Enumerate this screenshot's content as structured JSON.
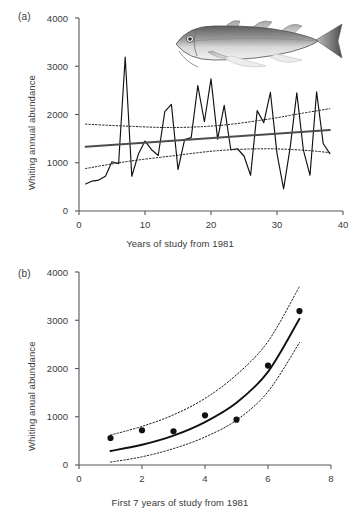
{
  "figure": {
    "panel_a_label": "(a)",
    "panel_b_label": "(b)",
    "fish_icon": "whiting-fish-illustration"
  },
  "chart_data": [
    {
      "id": "panel-a",
      "type": "line",
      "title": "",
      "panel": "(a)",
      "xlabel": "Years of study from 1981",
      "ylabel": "Whiting annual abundance",
      "xlim": [
        0,
        40
      ],
      "ylim": [
        0,
        4000
      ],
      "xticks": [
        0,
        10,
        20,
        30,
        40
      ],
      "yticks": [
        0,
        1000,
        2000,
        3000,
        4000
      ],
      "xtick_labels": [
        "0",
        "10",
        "20",
        "30",
        "40"
      ],
      "ytick_labels": [
        "0",
        "1000",
        "2000",
        "3000",
        "4000"
      ],
      "grid": false,
      "legend": "none",
      "annotation": "whiting fish illustration, top right",
      "series": [
        {
          "name": "Whiting annual abundance",
          "style": "solid-thin-black",
          "x": [
            1,
            2,
            3,
            4,
            5,
            6,
            7,
            8,
            9,
            10,
            11,
            12,
            13,
            14,
            15,
            16,
            17,
            18,
            19,
            20,
            21,
            22,
            23,
            24,
            25,
            26,
            27,
            28,
            29,
            30,
            31,
            32,
            33,
            34,
            35,
            36,
            37,
            38
          ],
          "values": [
            560,
            620,
            640,
            720,
            1020,
            980,
            3190,
            720,
            1180,
            1450,
            1270,
            1150,
            2060,
            2210,
            860,
            1480,
            1520,
            2600,
            1850,
            2740,
            1490,
            2190,
            1270,
            1290,
            1140,
            740,
            2080,
            1830,
            2460,
            1190,
            460,
            1320,
            2450,
            1260,
            740,
            2470,
            1400,
            1190
          ]
        },
        {
          "name": "Linear trend",
          "style": "solid-thick-gray",
          "x": [
            1,
            38
          ],
          "values": [
            1330,
            1680
          ]
        },
        {
          "name": "Upper confidence band",
          "style": "dotted-black",
          "x": [
            1,
            7,
            14,
            21,
            28,
            34,
            38
          ],
          "values": [
            1800,
            1760,
            1730,
            1770,
            1890,
            2030,
            2120
          ]
        },
        {
          "name": "Lower confidence band",
          "style": "dotted-black",
          "x": [
            1,
            7,
            14,
            21,
            28,
            34,
            38
          ],
          "values": [
            880,
            1020,
            1140,
            1250,
            1290,
            1260,
            1210
          ]
        }
      ]
    },
    {
      "id": "panel-b",
      "type": "scatter",
      "title": "",
      "panel": "(b)",
      "xlabel": "First 7 years of study from 1981",
      "ylabel": "Whiting anual abundance",
      "xlim": [
        0,
        8
      ],
      "ylim": [
        0,
        4000
      ],
      "xticks": [
        0,
        2,
        4,
        6,
        8
      ],
      "yticks": [
        0,
        1000,
        2000,
        3000,
        4000
      ],
      "xtick_labels": [
        "0",
        "2",
        "4",
        "6",
        "8"
      ],
      "ytick_labels": [
        "0",
        "1000",
        "2000",
        "3000",
        "4000"
      ],
      "grid": false,
      "legend": "none",
      "points": {
        "x": [
          1,
          2,
          3,
          4,
          5,
          6,
          7
        ],
        "values": [
          560,
          720,
          700,
          1030,
          940,
          2060,
          3190
        ]
      },
      "series": [
        {
          "name": "Exponential fit",
          "style": "solid-thick-black",
          "x": [
            1,
            2,
            3,
            4,
            5,
            6,
            7
          ],
          "values": [
            290,
            420,
            610,
            890,
            1290,
            1930,
            3030
          ]
        },
        {
          "name": "Upper confidence band",
          "style": "dotted-black",
          "x": [
            1,
            2,
            3,
            4,
            5,
            6,
            7
          ],
          "values": [
            620,
            800,
            1040,
            1380,
            1870,
            2560,
            3700
          ]
        },
        {
          "name": "Lower confidence band",
          "style": "dotted-black",
          "x": [
            1,
            2,
            3,
            4,
            5,
            6,
            7
          ],
          "values": [
            60,
            170,
            340,
            580,
            930,
            1520,
            2540
          ]
        }
      ]
    }
  ],
  "colors": {
    "text": "#3a3a3a",
    "axis": "#55565a",
    "data_line": "#111111",
    "trend_line": "#4d4d4d",
    "band_line": "#1a1a1a"
  }
}
